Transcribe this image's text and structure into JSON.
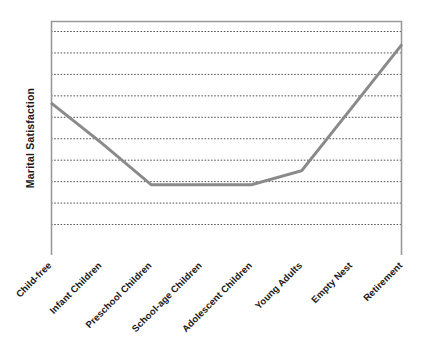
{
  "chart_data": {
    "type": "line",
    "title": "",
    "subtitle": "",
    "xlabel": "",
    "ylabel": "Marital Satisfaction",
    "categories": [
      "Child-free",
      "Infant Children",
      "Preschool Children",
      "School-age Children",
      "Adolescent Children",
      "Young Adults",
      "Empty Nest",
      "Retirement"
    ],
    "values": [
      6.5,
      4.8,
      3.0,
      3.0,
      3.0,
      3.6,
      6.3,
      9.0
    ],
    "series": [
      {
        "name": "Marital Satisfaction",
        "values": [
          6.5,
          4.8,
          3.0,
          3.0,
          3.0,
          3.6,
          6.3,
          9.0
        ],
        "color": "#8a8a8a"
      }
    ],
    "ylim": [
      0,
      10
    ],
    "yticks": [
      1,
      2,
      3,
      4,
      5,
      6,
      7,
      8,
      9,
      10
    ],
    "ytick_labels": [
      "",
      "",
      "",
      "",
      "",
      "",
      "",
      "",
      "",
      ""
    ],
    "gridlines": {
      "horizontal": true,
      "vertical": false,
      "style": "dotted",
      "count": 10,
      "color": "#555555"
    },
    "legend": {
      "visible": false,
      "position": "none",
      "entries": []
    },
    "axes": {
      "left_axis_visible": true,
      "right_axis_visible": true,
      "top_axis_visible": true,
      "bottom_axis_visible": false,
      "axis_color": "#9a9a9a",
      "tick_labels_rotated": true,
      "tick_label_rotation_degrees": -45
    },
    "annotations": [],
    "plot_area": {
      "left": 51,
      "right": 402,
      "top": 21,
      "bottom": 255
    },
    "background_color": "#ffffff",
    "line_width": 3
  },
  "figure": {
    "width": 423,
    "height": 359
  }
}
